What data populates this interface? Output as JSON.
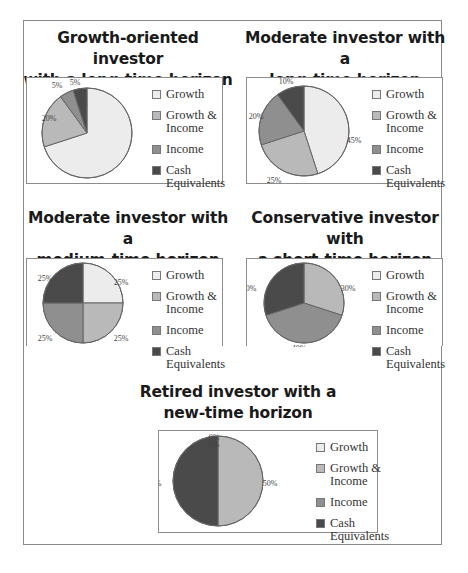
{
  "colors": {
    "growth": "#ececec",
    "growth_income": "#b9b9b9",
    "income": "#8f8f8f",
    "cash": "#4a4a4a",
    "outline": "#666666"
  },
  "legend": {
    "growth": "Growth",
    "growth_income_1": "Growth &",
    "growth_income_2": "Income",
    "income": "Income",
    "cash_1": "Cash",
    "cash_2": "Equivalents"
  },
  "panels": [
    {
      "title_1": "Growth-oriented investor",
      "title_2": "with a long-time horizon"
    },
    {
      "title_1": "Moderate investor with a",
      "title_2": "long-time horizon"
    },
    {
      "title_1": "Moderate investor with a",
      "title_2": "medium-time horizon"
    },
    {
      "title_1": "Conservative investor with",
      "title_2": "a short-time horizon"
    },
    {
      "title_1": "Retired investor with a",
      "title_2": "new-time horizon"
    }
  ],
  "chart_data": [
    {
      "type": "pie",
      "title": "Growth-oriented investor with a long-time horizon",
      "categories": [
        "Growth",
        "Growth & Income",
        "Income",
        "Cash Equivalents"
      ],
      "values": [
        70,
        20,
        5,
        5
      ],
      "labels": [
        "70%",
        "20%",
        "5%",
        "5%"
      ],
      "legend_position": "right"
    },
    {
      "type": "pie",
      "title": "Moderate investor with a long-time horizon",
      "categories": [
        "Growth",
        "Growth & Income",
        "Income",
        "Cash Equivalents"
      ],
      "values": [
        45,
        25,
        20,
        10
      ],
      "labels": [
        "45%",
        "25%",
        "20%",
        "10%"
      ],
      "legend_position": "right"
    },
    {
      "type": "pie",
      "title": "Moderate investor with a medium-time horizon",
      "categories": [
        "Growth",
        "Growth & Income",
        "Income",
        "Cash Equivalents"
      ],
      "values": [
        25,
        25,
        25,
        25
      ],
      "labels": [
        "25%",
        "25%",
        "25%",
        "25%"
      ],
      "legend_position": "right"
    },
    {
      "type": "pie",
      "title": "Conservative investor with a short-time horizon",
      "categories": [
        "Growth",
        "Growth & Income",
        "Income",
        "Cash Equivalents"
      ],
      "values": [
        0,
        30,
        40,
        30
      ],
      "labels": [
        "0%",
        "30%",
        "40%",
        "30%"
      ],
      "legend_position": "right"
    },
    {
      "type": "pie",
      "title": "Retired investor with a new-time horizon",
      "categories": [
        "Growth",
        "Growth & Income",
        "Income",
        "Cash Equivalents"
      ],
      "values": [
        0,
        50,
        0,
        50
      ],
      "labels": [
        "0%",
        "50%",
        "0%",
        "50%"
      ],
      "legend_position": "right"
    }
  ]
}
